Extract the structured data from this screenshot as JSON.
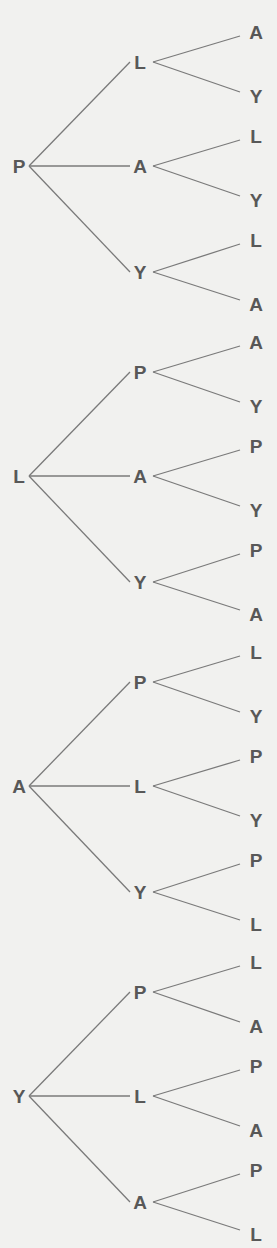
{
  "diagram": {
    "type": "tree",
    "colors": {
      "background": "#f1f1ef",
      "line": "#7a7a7a",
      "text": "#585858"
    },
    "trees": [
      {
        "root": "P",
        "children": [
          {
            "label": "L",
            "leaves": [
              "A",
              "Y"
            ]
          },
          {
            "label": "A",
            "leaves": [
              "L",
              "Y"
            ]
          },
          {
            "label": "Y",
            "leaves": [
              "L",
              "A"
            ]
          }
        ]
      },
      {
        "root": "L",
        "children": [
          {
            "label": "P",
            "leaves": [
              "A",
              "Y"
            ]
          },
          {
            "label": "A",
            "leaves": [
              "P",
              "Y"
            ]
          },
          {
            "label": "Y",
            "leaves": [
              "P",
              "A"
            ]
          }
        ]
      },
      {
        "root": "A",
        "children": [
          {
            "label": "P",
            "leaves": [
              "L",
              "Y"
            ]
          },
          {
            "label": "L",
            "leaves": [
              "P",
              "Y"
            ]
          },
          {
            "label": "Y",
            "leaves": [
              "P",
              "L"
            ]
          }
        ]
      },
      {
        "root": "Y",
        "children": [
          {
            "label": "P",
            "leaves": [
              "L",
              "A"
            ]
          },
          {
            "label": "L",
            "leaves": [
              "P",
              "A"
            ]
          },
          {
            "label": "A",
            "leaves": [
              "P",
              "L"
            ]
          }
        ]
      }
    ]
  }
}
